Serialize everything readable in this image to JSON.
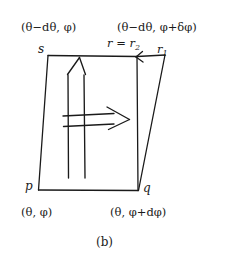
{
  "figure": {
    "caption": "(b)",
    "stroke_color": "#1a1a1a",
    "background_color": "#ffffff",
    "vertices": {
      "s": "s",
      "p": "p",
      "q": "q",
      "r1": "r",
      "r1_sub": "1",
      "r2_prefix": "r = r",
      "r2_sub": "2"
    },
    "coordinates": {
      "top_left": "(θ−dθ, φ)",
      "top_right": "(θ−dθ, φ+δφ)",
      "bottom_left": "(θ, φ)",
      "bottom_right": "(θ, φ+dφ)"
    },
    "arrows": {
      "up_arrow_label": "",
      "right_arrow_label": "",
      "corner_arrow_label": ""
    }
  }
}
